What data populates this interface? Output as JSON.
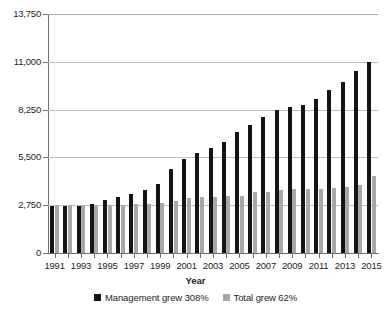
{
  "chart_data": {
    "type": "bar",
    "title": "",
    "subtitle": "",
    "xlabel": "Year",
    "ylabel": "",
    "ylim": [
      0,
      13750
    ],
    "ytick_labels": [
      "13,750",
      "11,000",
      "8,250",
      "5,500",
      "2,750",
      "0"
    ],
    "ytick_values": [
      13750,
      11000,
      8250,
      5500,
      2750,
      0
    ],
    "grid": true,
    "legend_position": "bottom-center",
    "categories": [
      "1991",
      "1992",
      "1993",
      "1994",
      "1995",
      "1996",
      "1997",
      "1998",
      "1999",
      "2000",
      "2001",
      "2002",
      "2003",
      "2004",
      "2005",
      "2006",
      "2007",
      "2008",
      "2009",
      "2010",
      "2011",
      "2012",
      "2013",
      "2014",
      "2015"
    ],
    "visible_xtick_labels": [
      "1991",
      "1993",
      "1995",
      "1997",
      "1999",
      "2001",
      "2003",
      "2005",
      "2007",
      "2009",
      "2011",
      "2013",
      "2015"
    ],
    "series": [
      {
        "name": "Management grew 308%",
        "color": "#141414",
        "values": [
          2700,
          2700,
          2700,
          2820,
          3050,
          3200,
          3400,
          3600,
          3950,
          4850,
          5400,
          5750,
          6050,
          6400,
          6950,
          7350,
          7800,
          8250,
          8400,
          8500,
          8850,
          9400,
          9850,
          10450,
          11000
        ]
      },
      {
        "name": "Total grew 62%",
        "color": "#a6a8ab",
        "values": [
          2750,
          2750,
          2750,
          2760,
          2780,
          2790,
          2800,
          2810,
          2900,
          3000,
          3150,
          3200,
          3220,
          3280,
          3300,
          3500,
          3520,
          3650,
          3660,
          3670,
          3700,
          3760,
          3800,
          3900,
          4450
        ]
      }
    ]
  },
  "legend": {
    "items": [
      {
        "label": "Management grew 308%",
        "swatch": "#141414"
      },
      {
        "label": "Total grew 62%",
        "swatch": "#a6a8ab"
      }
    ]
  },
  "axis": {
    "x_title": "Year"
  }
}
